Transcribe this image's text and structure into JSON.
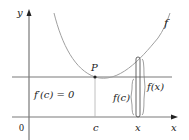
{
  "diagram": {
    "axes": {
      "x_label": "x",
      "y_label": "y",
      "origin_label": "0"
    },
    "curve": {
      "label": "f",
      "color": "#a0a0a0"
    },
    "point": {
      "label": "P",
      "annotation": "f′(c) = 0"
    },
    "tick_labels": {
      "c": "c",
      "x": "x"
    },
    "segments": {
      "fc_label": "f(c)",
      "fx_label": "f(x)"
    },
    "colors": {
      "axis": "#8c8c8c",
      "line": "#7a7a7a",
      "text": "#222222"
    }
  }
}
